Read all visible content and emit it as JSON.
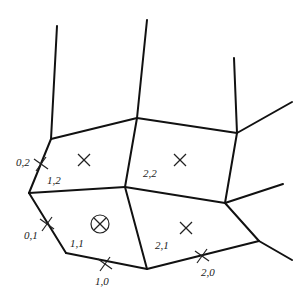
{
  "diagram": {
    "vertices": {
      "A": [
        51,
        139
      ],
      "B": [
        137,
        118
      ],
      "C": [
        237,
        133
      ],
      "D": [
        29,
        193
      ],
      "F": [
        125,
        187
      ],
      "H": [
        225,
        203
      ],
      "E": [
        66,
        253
      ],
      "G": [
        147,
        269
      ],
      "I": [
        259,
        241
      ]
    },
    "edges": [
      {
        "from": [
          51,
          139
        ],
        "to": [
          57,
          26
        ]
      },
      {
        "from": [
          137,
          118
        ],
        "to": [
          147,
          20
        ]
      },
      {
        "from": [
          237,
          133
        ],
        "to": [
          234,
          58
        ]
      },
      {
        "from": [
          237,
          133
        ],
        "to": [
          292,
          102
        ]
      },
      {
        "from": [
          51,
          139
        ],
        "to": [
          137,
          118
        ]
      },
      {
        "from": [
          137,
          118
        ],
        "to": [
          237,
          133
        ]
      },
      {
        "from": [
          51,
          139
        ],
        "to": [
          29,
          193
        ]
      },
      {
        "from": [
          137,
          118
        ],
        "to": [
          125,
          187
        ]
      },
      {
        "from": [
          237,
          133
        ],
        "to": [
          225,
          203
        ]
      },
      {
        "from": [
          29,
          193
        ],
        "to": [
          125,
          187
        ]
      },
      {
        "from": [
          125,
          187
        ],
        "to": [
          225,
          203
        ]
      },
      {
        "from": [
          225,
          203
        ],
        "to": [
          283,
          184
        ]
      },
      {
        "from": [
          29,
          193
        ],
        "to": [
          66,
          253
        ]
      },
      {
        "from": [
          125,
          187
        ],
        "to": [
          147,
          269
        ]
      },
      {
        "from": [
          225,
          203
        ],
        "to": [
          259,
          241
        ]
      },
      {
        "from": [
          66,
          253
        ],
        "to": [
          147,
          269
        ]
      },
      {
        "from": [
          147,
          269
        ],
        "to": [
          259,
          241
        ]
      },
      {
        "from": [
          259,
          241
        ],
        "to": [
          292,
          260
        ]
      }
    ],
    "cell_markers": [
      {
        "type": "x",
        "pos": [
          84,
          160
        ],
        "cell": "1,2"
      },
      {
        "type": "x",
        "pos": [
          180,
          160
        ],
        "cell": "2,2"
      },
      {
        "type": "circled-x",
        "pos": [
          100,
          224
        ],
        "cell": "1,1"
      },
      {
        "type": "x",
        "pos": [
          186,
          228
        ],
        "cell": "2,1"
      }
    ],
    "edge_markers": [
      {
        "type": "plus-cross",
        "pos": [
          41,
          164
        ],
        "label": "0,2"
      },
      {
        "type": "plus-cross",
        "pos": [
          47,
          224
        ],
        "label": "0,1"
      },
      {
        "type": "plus-cross",
        "pos": [
          105,
          264
        ],
        "label": "1,0"
      },
      {
        "type": "plus-cross",
        "pos": [
          202,
          256
        ],
        "label": "2,0"
      }
    ],
    "labels": [
      {
        "text": "0,2",
        "pos": [
          16,
          166
        ]
      },
      {
        "text": "1,2",
        "pos": [
          47,
          184
        ]
      },
      {
        "text": "2,2",
        "pos": [
          143,
          177
        ]
      },
      {
        "text": "0,1",
        "pos": [
          24,
          239
        ]
      },
      {
        "text": "1,1",
        "pos": [
          70,
          247
        ]
      },
      {
        "text": "2,1",
        "pos": [
          155,
          249
        ]
      },
      {
        "text": "1,0",
        "pos": [
          95,
          285
        ]
      },
      {
        "text": "2,0",
        "pos": [
          201,
          276
        ]
      }
    ]
  }
}
